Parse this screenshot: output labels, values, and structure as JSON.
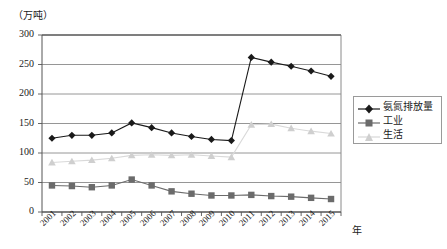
{
  "chart_data": {
    "type": "line",
    "title": "",
    "unit_label": "（万吨）",
    "xlabel": "年",
    "ylabel": "",
    "ylim": [
      0,
      300
    ],
    "yticks": [
      0,
      50,
      100,
      150,
      200,
      250,
      300
    ],
    "grid": true,
    "legend_position": "right",
    "categories": [
      "2001",
      "2002",
      "2003",
      "2004",
      "2005",
      "2006",
      "2007",
      "2008",
      "2009",
      "2010",
      "2011",
      "2012",
      "2013",
      "2014",
      "2015"
    ],
    "series": [
      {
        "name": "氨氮排放量",
        "marker": "diamond",
        "color": "#1a1a1a",
        "values": [
          125,
          130,
          130,
          134,
          151,
          143,
          134,
          128,
          123,
          121,
          262,
          254,
          247,
          239,
          230
        ]
      },
      {
        "name": "工业",
        "marker": "square",
        "color": "#6b6b6b",
        "values": [
          45,
          44,
          42,
          45,
          55,
          45,
          35,
          31,
          28,
          28,
          29,
          27,
          26,
          24,
          22
        ]
      },
      {
        "name": "生活",
        "marker": "triangle",
        "color": "#cfcfcf",
        "values": [
          84,
          86,
          88,
          91,
          96,
          97,
          96,
          97,
          95,
          93,
          148,
          149,
          142,
          137,
          133
        ]
      }
    ]
  },
  "axis": {
    "unit": "（万吨）",
    "x_axis_name": "年"
  },
  "legend": {
    "items": [
      {
        "label": "氨氮排放量"
      },
      {
        "label": "工业"
      },
      {
        "label": "生活"
      }
    ]
  }
}
